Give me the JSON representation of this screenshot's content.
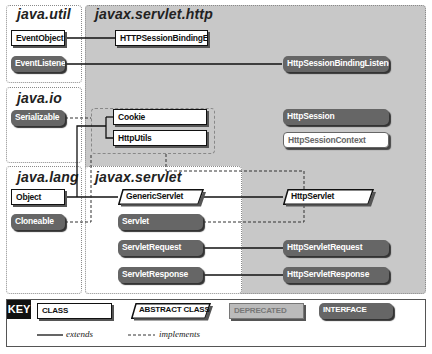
{
  "packages": {
    "java_util": "java.util",
    "java_io": "java.io",
    "java_lang": "java.lang",
    "javax_servlet_http": "javax.servlet.http",
    "javax_servlet": "javax.servlet"
  },
  "classes": {
    "EventObject": "EventObject",
    "EventListener": "EventListener",
    "Serializable": "Serializable",
    "Object": "Object",
    "Cloneable": "Cloneable",
    "HTTPSessionBindingEvent": "HTTPSessionBindingEvent",
    "HttpSessionBindingListener": "HttpSessionBindingListener",
    "Cookie": "Cookie",
    "HttpUtils": "HttpUtils",
    "HttpSession": "HttpSession",
    "HttpSessionContext": "HttpSessionContext",
    "GenericServlet": "GenericServlet",
    "Servlet": "Servlet",
    "ServletRequest": "ServletRequest",
    "ServletResponse": "ServletResponse",
    "HttpServlet": "HttpServlet",
    "HttpServletRequest": "HttpServletRequest",
    "HttpServletResponse": "HttpServletResponse"
  },
  "key": {
    "title": "KEY",
    "class": "CLASS",
    "abstract_class": "ABSTRACT CLASS",
    "deprecated": "DEPRECATED",
    "interface": "INTERFACE",
    "extends": "extends",
    "implements": "implements"
  }
}
